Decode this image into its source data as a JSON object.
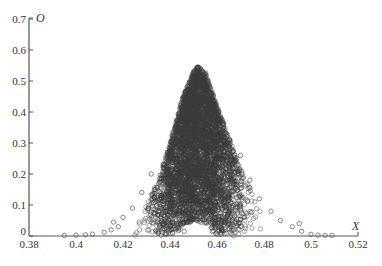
{
  "chart_data": {
    "type": "scatter",
    "title": "",
    "xlabel": "X",
    "ylabel": "O",
    "xlim": [
      0.38,
      0.52
    ],
    "ylim": [
      0,
      0.7
    ],
    "x_ticks": [
      "0.38",
      "0.4",
      "0.42",
      "0.44",
      "0.46",
      "0.48",
      "0.5",
      "0.52"
    ],
    "y_ticks": [
      "0",
      "0.1",
      "0.2",
      "0.3",
      "0.4",
      "0.5",
      "0.6",
      "0.7"
    ],
    "grid": false,
    "legend": null,
    "marker": "open circle",
    "marker_color": "#3a3a3a",
    "envelope": {
      "x": [
        0.395,
        0.41,
        0.42,
        0.43,
        0.435,
        0.44,
        0.445,
        0.45,
        0.452,
        0.455,
        0.46,
        0.465,
        0.47,
        0.475,
        0.48,
        0.49,
        0.5,
        0.51
      ],
      "upper": [
        0.0,
        0.01,
        0.04,
        0.1,
        0.18,
        0.3,
        0.44,
        0.53,
        0.55,
        0.53,
        0.42,
        0.32,
        0.22,
        0.14,
        0.08,
        0.04,
        0.02,
        0.0
      ]
    },
    "inner_gap": {
      "x_center": 0.451,
      "x_width": 0.016,
      "max_o": 0.045
    }
  },
  "axes": {
    "x_name": "X",
    "y_name": "O"
  },
  "caption": ""
}
